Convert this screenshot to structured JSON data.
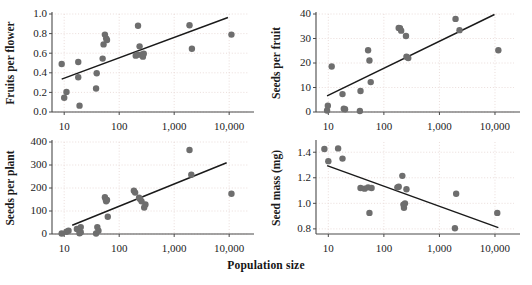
{
  "figure": {
    "shared_xlabel": "Population size",
    "background": "#ffffff",
    "point_color": "#6e6e6e",
    "line_color": "#1a1a1a",
    "grid_color": "#e8d9d6",
    "axis_color": "#4a4a4a",
    "caption_fragment": ""
  },
  "chart_data": [
    {
      "type": "scatter",
      "id": "fruits-per-flower",
      "title": "",
      "xlabel": "Population size",
      "ylabel": "Fruits per flower",
      "xscale": "log",
      "xlim": [
        6,
        22000
      ],
      "ylim": [
        0.0,
        1.0
      ],
      "xticks": [
        10,
        100,
        1000,
        10000
      ],
      "xtick_labels": [
        "10",
        "100",
        "1,000",
        "10,000"
      ],
      "yticks": [
        0.0,
        0.2,
        0.4,
        0.6,
        0.8,
        1.0
      ],
      "ytick_labels": [
        "0.0",
        "0.2",
        "0.4",
        "0.6",
        "0.8",
        "1.0"
      ],
      "grid": true,
      "legend": "none",
      "points": [
        [
          9,
          0.49
        ],
        [
          10,
          0.145
        ],
        [
          11,
          0.205
        ],
        [
          18,
          0.355
        ],
        [
          18,
          0.51
        ],
        [
          19,
          0.065
        ],
        [
          38,
          0.24
        ],
        [
          39,
          0.395
        ],
        [
          50,
          0.545
        ],
        [
          52,
          0.69
        ],
        [
          55,
          0.79
        ],
        [
          58,
          0.75
        ],
        [
          60,
          0.735
        ],
        [
          200,
          0.575
        ],
        [
          215,
          0.585
        ],
        [
          220,
          0.88
        ],
        [
          235,
          0.67
        ],
        [
          250,
          0.585
        ],
        [
          270,
          0.565
        ],
        [
          280,
          0.595
        ],
        [
          1900,
          0.885
        ],
        [
          2100,
          0.645
        ],
        [
          11000,
          0.79
        ]
      ],
      "trendline": {
        "x": [
          9,
          9500
        ],
        "y": [
          0.335,
          0.965
        ]
      }
    },
    {
      "type": "scatter",
      "id": "seeds-per-fruit",
      "title": "",
      "xlabel": "Population size",
      "ylabel": "Seeds per fruit",
      "xscale": "log",
      "xlim": [
        6,
        22000
      ],
      "ylim": [
        0,
        40
      ],
      "xticks": [
        10,
        100,
        1000,
        10000
      ],
      "xtick_labels": [
        "10",
        "100",
        "1,000",
        "10,000"
      ],
      "yticks": [
        0,
        10,
        20,
        30,
        40
      ],
      "ytick_labels": [
        "0",
        "10",
        "20",
        "30",
        "40"
      ],
      "grid": true,
      "legend": "none",
      "points": [
        [
          9.5,
          0.6
        ],
        [
          9.8,
          2.6
        ],
        [
          11.5,
          18.6
        ],
        [
          18,
          7.3
        ],
        [
          19,
          1.3
        ],
        [
          20,
          1.1
        ],
        [
          37,
          0.4
        ],
        [
          38,
          8.6
        ],
        [
          52,
          25.2
        ],
        [
          55,
          21.0
        ],
        [
          58,
          12.2
        ],
        [
          185,
          34.3
        ],
        [
          195,
          34.2
        ],
        [
          205,
          33.2
        ],
        [
          250,
          31.0
        ],
        [
          255,
          22.6
        ],
        [
          265,
          22.3
        ],
        [
          275,
          22.0
        ],
        [
          1950,
          38.0
        ],
        [
          2300,
          33.4
        ],
        [
          11500,
          25.2
        ]
      ],
      "trendline": {
        "x": [
          9.5,
          9800
        ],
        "y": [
          6.6,
          39.8
        ]
      }
    },
    {
      "type": "scatter",
      "id": "seeds-per-plant",
      "title": "",
      "xlabel": "Population size",
      "ylabel": "Seeds per plant",
      "xscale": "log",
      "xlim": [
        6,
        22000
      ],
      "ylim": [
        0,
        400
      ],
      "xticks": [
        10,
        100,
        1000,
        10000
      ],
      "xtick_labels": [
        "10",
        "100",
        "1,000",
        "10,000"
      ],
      "yticks": [
        0,
        100,
        200,
        300,
        400
      ],
      "ytick_labels": [
        "0",
        "100",
        "200",
        "300",
        "400"
      ],
      "grid": true,
      "legend": "none",
      "points": [
        [
          9,
          2
        ],
        [
          11,
          10
        ],
        [
          12,
          14
        ],
        [
          17,
          22
        ],
        [
          18,
          20
        ],
        [
          19,
          3
        ],
        [
          20,
          8
        ],
        [
          20,
          30
        ],
        [
          38,
          2
        ],
        [
          40,
          30
        ],
        [
          42,
          14
        ],
        [
          55,
          160
        ],
        [
          57,
          150
        ],
        [
          58,
          142
        ],
        [
          60,
          148
        ],
        [
          62,
          75
        ],
        [
          185,
          188
        ],
        [
          195,
          180
        ],
        [
          230,
          158
        ],
        [
          240,
          152
        ],
        [
          255,
          142
        ],
        [
          285,
          115
        ],
        [
          300,
          128
        ],
        [
          1900,
          365
        ],
        [
          2050,
          258
        ],
        [
          11000,
          175
        ]
      ],
      "trendline": {
        "x": [
          14,
          9000
        ],
        "y": [
          38,
          310
        ]
      }
    },
    {
      "type": "scatter",
      "id": "seed-mass",
      "title": "",
      "xlabel": "Population size",
      "ylabel": "Seed mass (mg)",
      "xscale": "log",
      "xlim": [
        6,
        22000
      ],
      "ylim": [
        0.76,
        1.48
      ],
      "xticks": [
        10,
        100,
        1000,
        10000
      ],
      "xtick_labels": [
        "10",
        "100",
        "1,000",
        "10,000"
      ],
      "yticks": [
        0.8,
        1.0,
        1.2,
        1.4
      ],
      "ytick_labels": [
        "0.8",
        "1.0",
        "1.2",
        "1.4"
      ],
      "grid": true,
      "legend": "none",
      "points": [
        [
          8.5,
          1.425
        ],
        [
          10,
          1.33
        ],
        [
          15,
          1.43
        ],
        [
          18,
          1.35
        ],
        [
          38,
          1.12
        ],
        [
          45,
          1.115
        ],
        [
          52,
          1.125
        ],
        [
          55,
          0.925
        ],
        [
          60,
          1.12
        ],
        [
          175,
          1.125
        ],
        [
          185,
          1.13
        ],
        [
          215,
          1.215
        ],
        [
          225,
          0.99
        ],
        [
          230,
          0.965
        ],
        [
          240,
          1.0
        ],
        [
          255,
          1.11
        ],
        [
          1900,
          0.805
        ],
        [
          2000,
          1.075
        ],
        [
          11000,
          0.925
        ]
      ],
      "trendline": {
        "x": [
          9.5,
          11500
        ],
        "y": [
          1.295,
          0.81
        ]
      }
    }
  ]
}
